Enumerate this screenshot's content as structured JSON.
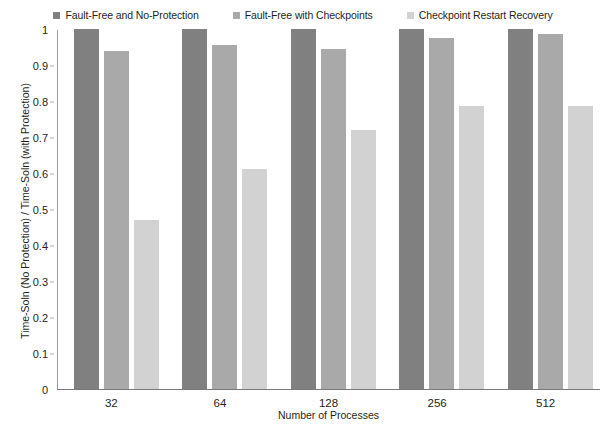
{
  "chart_data": {
    "type": "bar",
    "title": "",
    "xlabel": "Number of Processes",
    "ylabel": "Time-Soln (No Protection) / Time-Soln (with Protection)",
    "categories": [
      "32",
      "64",
      "128",
      "256",
      "512"
    ],
    "ylim": [
      0,
      1
    ],
    "ytick_labels": [
      "1",
      "0.9",
      "0.8",
      "0.7",
      "0.6",
      "0.5",
      "0.4",
      "0.3",
      "0.2",
      "0.1",
      "0"
    ],
    "ytick_values": [
      1,
      0.9,
      0.8,
      0.7,
      0.6,
      0.5,
      0.4,
      0.3,
      0.2,
      0.1,
      0
    ],
    "grid": false,
    "legend_position": "top",
    "series": [
      {
        "name": "Fault-Free and No-Protection",
        "color": "#808080",
        "values": [
          1.0,
          1.0,
          1.0,
          1.0,
          1.0
        ]
      },
      {
        "name": "Fault-Free with Checkpoints",
        "color": "#a9a9a9",
        "values": [
          0.94,
          0.955,
          0.945,
          0.975,
          0.985
        ]
      },
      {
        "name": "Checkpoint Restart Recovery",
        "color": "#d2d2d2",
        "values": [
          0.47,
          0.61,
          0.72,
          0.785,
          0.785
        ]
      }
    ]
  }
}
